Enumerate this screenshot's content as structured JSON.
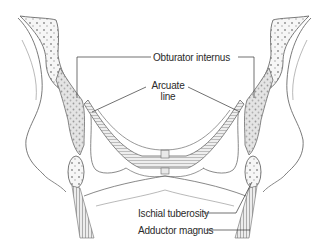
{
  "diagram": {
    "colors": {
      "outline": "#6b6b6b",
      "bone_fill": "#f4f4f4",
      "muscle_fill": "#d9d9d9",
      "leader_line": "#333333",
      "text": "#2b2b2b"
    },
    "labels": {
      "obturator_internus": "Obturator internus",
      "arcuate_line_1": "Arcuate",
      "arcuate_line_2": "line",
      "ischial_tuberosity": "Ischial tuberosity",
      "adductor_magnus": "Adductor magnus"
    }
  }
}
